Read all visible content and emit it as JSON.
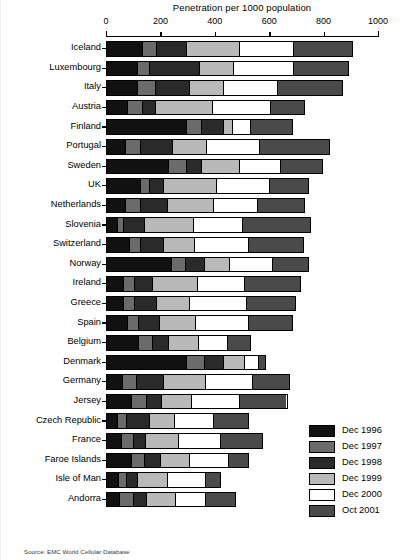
{
  "chart_data": {
    "type": "bar",
    "orientation": "horizontal",
    "stacked": true,
    "title": "Penetration per 1000 population",
    "xlabel": "",
    "ylabel": "",
    "xlim": [
      0,
      1000
    ],
    "xticks": [
      0,
      200,
      400,
      600,
      800,
      1000
    ],
    "grid": false,
    "legend_position": "bottom-right",
    "source": "Source: EMC World Cellular Database",
    "categories": [
      "Iceland",
      "Luxembourg",
      "Italy",
      "Austria",
      "Finland",
      "Portugal",
      "Sweden",
      "UK",
      "Netherlands",
      "Slovenia",
      "Switzerland",
      "Norway",
      "Ireland",
      "Greece",
      "Spain",
      "Belgium",
      "Denmark",
      "Germany",
      "Jersey",
      "Czech Republic",
      "France",
      "Faroe Islands",
      "Isle of Man",
      "Andorra"
    ],
    "series": [
      {
        "name": "Dec 1996",
        "color": "#111111",
        "values": [
          130,
          110,
          110,
          75,
          290,
          65,
          225,
          120,
          65,
          35,
          80,
          235,
          60,
          60,
          75,
          115,
          290,
          55,
          90,
          35,
          50,
          90,
          40,
          45
        ]
      },
      {
        "name": "Dec 1997",
        "color": "#6b6b6b",
        "values": [
          50,
          45,
          65,
          55,
          55,
          55,
          65,
          35,
          55,
          25,
          40,
          50,
          40,
          40,
          40,
          50,
          65,
          50,
          55,
          35,
          45,
          45,
          30,
          50
        ]
      },
      {
        "name": "Dec 1998",
        "color": "#2a2a2a",
        "values": [
          110,
          185,
          125,
          45,
          80,
          120,
          55,
          50,
          100,
          75,
          85,
          70,
          65,
          80,
          75,
          60,
          70,
          100,
          55,
          85,
          45,
          60,
          40,
          50
        ]
      },
      {
        "name": "Dec 1999",
        "color": "#b9b9b9",
        "values": [
          195,
          125,
          125,
          210,
          35,
          125,
          140,
          195,
          170,
          180,
          115,
          95,
          165,
          120,
          135,
          110,
          80,
          155,
          110,
          90,
          120,
          105,
          110,
          105
        ]
      },
      {
        "name": "Dec 2000",
        "color": "#ffffff",
        "values": [
          200,
          220,
          200,
          215,
          65,
          195,
          150,
          195,
          160,
          180,
          200,
          155,
          175,
          210,
          195,
          105,
          50,
          175,
          175,
          145,
          155,
          145,
          140,
          110
        ]
      },
      {
        "name": "Oct 2001",
        "color": "#4a4a4a",
        "values": [
          215,
          200,
          240,
          125,
          155,
          255,
          155,
          145,
          175,
          250,
          200,
          135,
          205,
          180,
          160,
          85,
          25,
          135,
          175,
          130,
          155,
          75,
          55,
          110
        ]
      }
    ],
    "totals": [
      900,
      885,
      865,
      725,
      680,
      815,
      790,
      740,
      725,
      745,
      720,
      740,
      710,
      690,
      680,
      525,
      580,
      670,
      660,
      520,
      570,
      520,
      415,
      470
    ]
  },
  "axis": {
    "tick_labels": [
      "0",
      "200",
      "400",
      "600",
      "800",
      "1000"
    ]
  },
  "legend": {
    "items": [
      {
        "label": "Dec 1996"
      },
      {
        "label": "Dec 1997"
      },
      {
        "label": "Dec 1998"
      },
      {
        "label": "Dec 1999"
      },
      {
        "label": "Dec 2000"
      },
      {
        "label": "Oct 2001"
      }
    ]
  },
  "footer": {
    "source": "Source: EMC World Cellular Database"
  }
}
